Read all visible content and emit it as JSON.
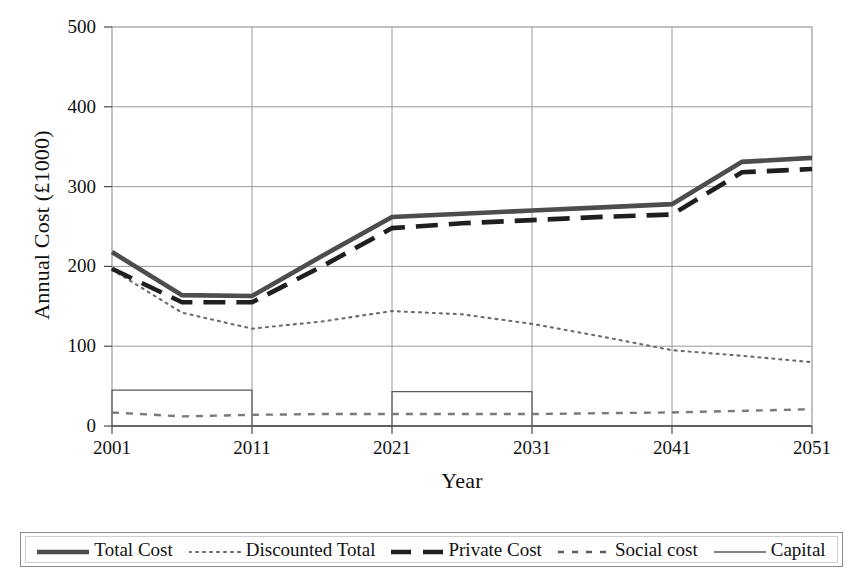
{
  "chart_data": {
    "type": "line",
    "title": "",
    "xlabel": "Year",
    "ylabel": "Annual Cost (£1000)",
    "xlim": [
      2001,
      2051
    ],
    "ylim": [
      0,
      500
    ],
    "xticks": [
      "2001",
      "2011",
      "2021",
      "2031",
      "2041",
      "2051"
    ],
    "yticks": [
      "0",
      "100",
      "200",
      "300",
      "400",
      "500"
    ],
    "grid": true,
    "legend_position": "bottom",
    "x": [
      2001,
      2006,
      2011,
      2016,
      2021,
      2026,
      2031,
      2036,
      2041,
      2046,
      2051
    ],
    "series": [
      {
        "name": "Total Cost",
        "style": "thick-solid",
        "color": "#4d4d4d",
        "values": [
          218,
          164,
          163,
          213,
          262,
          266,
          270,
          274,
          278,
          331,
          336
        ]
      },
      {
        "name": "Discounted Total",
        "style": "fine-dotted",
        "color": "#6b6b6b",
        "values": [
          196,
          142,
          122,
          131,
          144,
          140,
          128,
          112,
          95,
          88,
          80
        ]
      },
      {
        "name": "Private Cost",
        "style": "thick-dashed",
        "color": "#1f1f1f",
        "values": [
          197,
          155,
          155,
          200,
          248,
          254,
          258,
          262,
          265,
          318,
          322
        ]
      },
      {
        "name": "Social cost",
        "style": "dash-dot",
        "color": "#7a7a7a",
        "values": [
          17,
          12,
          14,
          15,
          15,
          15,
          15,
          16,
          17,
          19,
          21
        ]
      },
      {
        "name": "Capital",
        "style": "thin-solid",
        "color": "#5a5a5a",
        "values": [
          45,
          45,
          0,
          0,
          43,
          43,
          0,
          0,
          0,
          0,
          0
        ],
        "note": "step pulses: 45 from 2001-2006, 43 from 2021-2026, 0 elsewhere"
      }
    ],
    "legend": [
      {
        "label": "Total Cost",
        "style": "thick-solid"
      },
      {
        "label": "Discounted Total",
        "style": "fine-dotted"
      },
      {
        "label": "Private Cost",
        "style": "thick-dashed"
      },
      {
        "label": "Social cost",
        "style": "dash-dot"
      },
      {
        "label": "Capital",
        "style": "thin-solid"
      }
    ]
  }
}
